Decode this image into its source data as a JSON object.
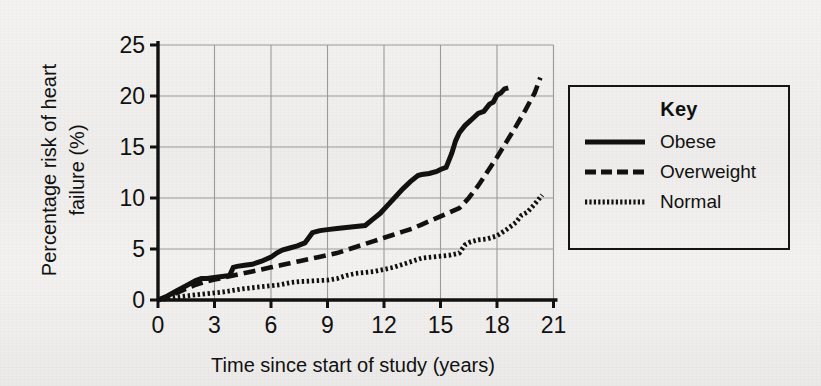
{
  "chart_data": {
    "type": "line",
    "title": "",
    "xlabel": "Time since start of study (years)",
    "ylabel": "Percentage risk of heart failure (%)",
    "ylabel_line1": "Percentage risk of heart",
    "ylabel_line2": "failure (%)",
    "xlim": [
      0,
      21
    ],
    "ylim": [
      0,
      25
    ],
    "xticks": [
      "0",
      "3",
      "6",
      "9",
      "12",
      "15",
      "18",
      "21"
    ],
    "xtick_values": [
      0,
      3,
      6,
      9,
      12,
      15,
      18,
      21
    ],
    "yticks": [
      "0",
      "5",
      "10",
      "15",
      "20",
      "25"
    ],
    "ytick_values": [
      0,
      5,
      10,
      15,
      20,
      25
    ],
    "grid": true,
    "legend_position": "right-outside",
    "legend_title": "Key",
    "series": [
      {
        "name": "Obese",
        "style": "solid",
        "color": "#111111",
        "x": [
          0,
          0.5,
          1.0,
          1.5,
          2.0,
          2.3,
          2.6,
          3.0,
          3.4,
          3.8,
          4.0,
          4.2,
          4.6,
          5.0,
          5.5,
          6.0,
          6.3,
          6.6,
          7.0,
          7.4,
          7.8,
          8.2,
          8.4,
          8.6,
          9.0,
          9.5,
          10.0,
          10.5,
          11.0,
          11.4,
          11.8,
          12.2,
          12.6,
          13.0,
          13.4,
          13.8,
          14.0,
          14.4,
          14.8,
          15.0,
          15.3,
          15.6,
          15.8,
          16.0,
          16.3,
          16.6,
          17.0,
          17.3,
          17.6,
          17.8,
          18.0,
          18.2,
          18.4,
          18.6
        ],
        "y": [
          0.0,
          0.4,
          0.9,
          1.4,
          1.9,
          2.1,
          2.1,
          2.2,
          2.3,
          2.4,
          3.2,
          3.3,
          3.4,
          3.5,
          3.8,
          4.2,
          4.6,
          4.9,
          5.1,
          5.3,
          5.6,
          6.6,
          6.7,
          6.8,
          6.9,
          7.0,
          7.1,
          7.2,
          7.3,
          7.9,
          8.5,
          9.3,
          10.1,
          10.9,
          11.6,
          12.2,
          12.3,
          12.4,
          12.6,
          12.8,
          13.0,
          14.4,
          15.6,
          16.4,
          17.1,
          17.6,
          18.3,
          18.5,
          19.2,
          19.4,
          20.1,
          20.3,
          20.7,
          20.8
        ]
      },
      {
        "name": "Overweight",
        "style": "dashed",
        "color": "#111111",
        "x": [
          0,
          0.5,
          1.0,
          1.5,
          2.0,
          2.5,
          3.0,
          3.5,
          4.0,
          4.5,
          5.0,
          5.5,
          6.0,
          6.5,
          7.0,
          7.5,
          8.0,
          8.5,
          9.0,
          9.5,
          10.0,
          10.5,
          11.0,
          11.5,
          12.0,
          12.5,
          13.0,
          13.5,
          14.0,
          14.5,
          15.0,
          15.5,
          16.0,
          16.5,
          17.0,
          17.5,
          18.0,
          18.5,
          19.0,
          19.5,
          20.0,
          20.3
        ],
        "y": [
          0.0,
          0.3,
          0.7,
          1.1,
          1.5,
          1.8,
          2.0,
          2.2,
          2.4,
          2.6,
          2.8,
          3.0,
          3.2,
          3.4,
          3.6,
          3.8,
          4.0,
          4.2,
          4.4,
          4.6,
          4.9,
          5.2,
          5.5,
          5.8,
          6.1,
          6.4,
          6.7,
          7.0,
          7.4,
          7.8,
          8.2,
          8.6,
          9.0,
          10.0,
          11.2,
          12.6,
          14.0,
          15.5,
          17.0,
          18.6,
          20.3,
          21.8
        ]
      },
      {
        "name": "Normal",
        "style": "dotted",
        "color": "#111111",
        "x": [
          0,
          0.5,
          1.0,
          1.5,
          2.0,
          2.5,
          3.0,
          3.5,
          4.0,
          4.5,
          5.0,
          5.5,
          6.0,
          6.5,
          7.0,
          7.5,
          8.0,
          8.5,
          9.0,
          9.5,
          10.0,
          10.5,
          11.0,
          11.5,
          12.0,
          12.5,
          13.0,
          13.5,
          14.0,
          14.5,
          15.0,
          15.5,
          16.0,
          16.3,
          16.6,
          17.0,
          17.5,
          18.0,
          18.5,
          19.0,
          19.3,
          19.6,
          20.0,
          20.4
        ],
        "y": [
          0.0,
          0.15,
          0.3,
          0.4,
          0.5,
          0.6,
          0.7,
          0.8,
          0.95,
          1.1,
          1.2,
          1.3,
          1.4,
          1.5,
          1.7,
          1.8,
          1.85,
          1.9,
          1.95,
          2.1,
          2.4,
          2.6,
          2.7,
          2.8,
          3.0,
          3.2,
          3.5,
          3.8,
          4.1,
          4.2,
          4.3,
          4.4,
          4.6,
          5.4,
          5.7,
          5.9,
          6.0,
          6.3,
          6.9,
          7.6,
          8.3,
          8.6,
          9.4,
          10.3
        ]
      }
    ]
  },
  "legend": {
    "title": "Key",
    "items": [
      {
        "label": "Obese",
        "style": "solid"
      },
      {
        "label": "Overweight",
        "style": "dashed"
      },
      {
        "label": "Normal",
        "style": "dotted"
      }
    ]
  },
  "axes": {
    "x_title": "Time since start of study (years)",
    "y_title_line1": "Percentage risk of heart",
    "y_title_line2": "failure (%)"
  },
  "colors": {
    "ink": "#111111",
    "grid": "#9a9a9a",
    "paper": "#f2f1ef"
  }
}
